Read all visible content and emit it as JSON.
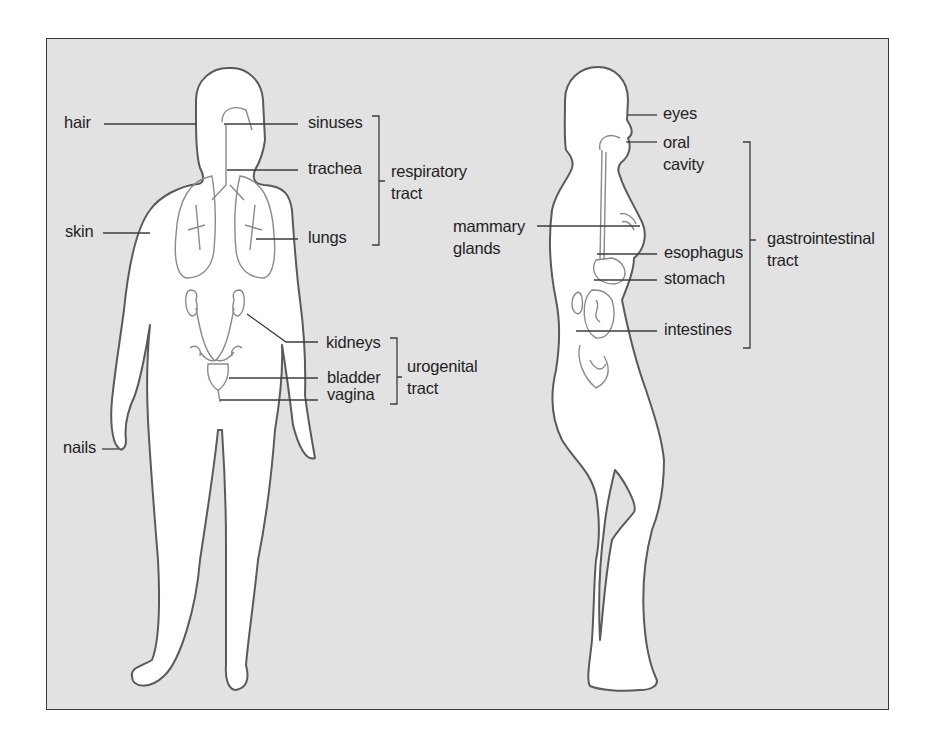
{
  "figure": {
    "front_view": {
      "labels": {
        "hair": "hair",
        "skin": "skin",
        "nails": "nails",
        "sinuses": "sinuses",
        "trachea": "trachea",
        "lungs": "lungs",
        "kidneys": "kidneys",
        "bladder": "bladder",
        "vagina": "vagina"
      },
      "groups": {
        "respiratory": "respiratory\ntract",
        "urogenital": "urogenital\ntract"
      }
    },
    "side_view": {
      "labels": {
        "eyes": "eyes",
        "oral_cavity": "oral\ncavity",
        "mammary_glands": "mammary\nglands",
        "esophagus": "esophagus",
        "stomach": "stomach",
        "intestines": "intestines"
      },
      "groups": {
        "gastrointestinal": "gastrointestinal\ntract"
      }
    },
    "colors": {
      "background": "#e2e2e2",
      "body_fill": "#ffffff",
      "outline": "#555555",
      "text": "#1f1f1f"
    }
  }
}
